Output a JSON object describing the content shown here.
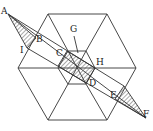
{
  "diagram": {
    "labels": [
      {
        "id": "A",
        "text": "A",
        "x": 1,
        "y": 14
      },
      {
        "id": "B",
        "text": "B",
        "x": 36,
        "y": 42
      },
      {
        "id": "I",
        "text": "I",
        "x": 20,
        "y": 53
      },
      {
        "id": "G",
        "text": "G",
        "x": 70,
        "y": 32
      },
      {
        "id": "C",
        "text": "C",
        "x": 56,
        "y": 56
      },
      {
        "id": "H",
        "text": "H",
        "x": 96,
        "y": 65
      },
      {
        "id": "D",
        "text": "D",
        "x": 89,
        "y": 86
      },
      {
        "id": "E",
        "text": "E",
        "x": 110,
        "y": 98
      },
      {
        "id": "F",
        "text": "F",
        "x": 143,
        "y": 117
      }
    ],
    "colors": {
      "stroke": "#333333",
      "hatch": "#555555",
      "background": "#ffffff"
    }
  }
}
